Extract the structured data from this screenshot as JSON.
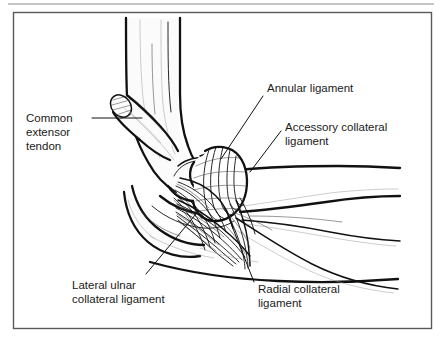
{
  "figure": {
    "background_color": "#ffffff",
    "ink_color": "#111111",
    "frame": {
      "top_rule_color": "#8c8c8c",
      "border_color": "#5a5a5a"
    }
  },
  "labels": {
    "common_extensor_tendon": {
      "line1": "Common",
      "line2": "extensor",
      "line3": "tendon"
    },
    "annular_ligament": {
      "line1": "Annular ligament"
    },
    "accessory_collateral_ligament": {
      "line1": "Accessory collateral",
      "line2": "ligament"
    },
    "lateral_ulnar_collateral_ligament": {
      "line1": "Lateral ulnar",
      "line2": "collateral ligament"
    },
    "radial_collateral_ligament": {
      "line1": "Radial collateral",
      "line2": "ligament"
    }
  },
  "structures": [
    {
      "name": "humerus",
      "kind": "bone"
    },
    {
      "name": "lateral-epicondyle",
      "kind": "bone"
    },
    {
      "name": "capitellum",
      "kind": "bone"
    },
    {
      "name": "olecranon",
      "kind": "bone"
    },
    {
      "name": "radius",
      "kind": "bone"
    },
    {
      "name": "ulna",
      "kind": "bone"
    },
    {
      "name": "common-extensor-tendon-stump",
      "kind": "tendon"
    },
    {
      "name": "annular-ligament",
      "kind": "ligament"
    },
    {
      "name": "accessory-collateral-ligament",
      "kind": "ligament"
    },
    {
      "name": "lateral-ulnar-collateral-ligament",
      "kind": "ligament"
    },
    {
      "name": "radial-collateral-ligament",
      "kind": "ligament"
    }
  ]
}
